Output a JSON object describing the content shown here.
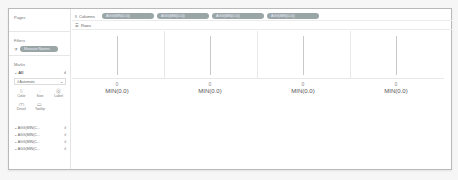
{
  "cards": {
    "pages": {
      "title": "Pages"
    },
    "filters": {
      "title": "Filters",
      "icon": "filter-icon",
      "pill": "Measure Names"
    },
    "marks": {
      "title": "Marks",
      "type_row": {
        "label": "All",
        "icon": "bar-chart-icon"
      },
      "mark_type": {
        "value": "Automatic",
        "icon": "dropdown-chevron-icon"
      },
      "buttons": [
        {
          "label": "Color",
          "icon": "⁞⁞"
        },
        {
          "label": "Size",
          "icon": "◌"
        },
        {
          "label": "Label",
          "icon": "⓪"
        },
        {
          "label": "Detail",
          "icon": "⩋"
        },
        {
          "label": "Tooltip",
          "icon": "▭"
        }
      ],
      "measures": [
        {
          "label": "AGG(MIN(C...",
          "icon": "bar-chart-icon"
        },
        {
          "label": "AGG(MIN(C...",
          "icon": "bar-chart-icon"
        },
        {
          "label": "AGG(MIN(C...",
          "icon": "bar-chart-icon"
        },
        {
          "label": "AGG(MIN(C...",
          "icon": "bar-chart-icon"
        }
      ]
    }
  },
  "shelves": {
    "columns": {
      "label": "Columns",
      "pills": [
        "AGG(MIN(0.0))",
        "AGG(MIN(0.0))",
        "AGG(MIN(0.0))",
        "AGG(MIN(0.0))"
      ]
    },
    "rows": {
      "label": "Rows",
      "pills": []
    }
  },
  "view": {
    "panes": [
      {
        "axis_tick": "0",
        "axis_title": "MIN(0.0)"
      },
      {
        "axis_tick": "0",
        "axis_title": "MIN(0.0)"
      },
      {
        "axis_tick": "0",
        "axis_title": "MIN(0.0)"
      },
      {
        "axis_tick": "0",
        "axis_title": "MIN(0.0)"
      }
    ]
  },
  "colors": {
    "pill": "#9aa6a6",
    "border": "#b9b9b9",
    "gridline": "#e8e8e8"
  }
}
